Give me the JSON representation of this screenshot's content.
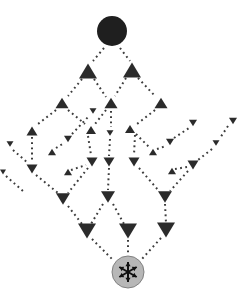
{
  "figure": {
    "width": 241,
    "height": 291,
    "background": "#ffffff",
    "ink_color": "#2b2b2b",
    "dot_color": "#3c3c3c",
    "source": {
      "cx": 112,
      "cy": 31,
      "r": 15,
      "fill": "#1f1f1f"
    },
    "sink": {
      "cx": 128,
      "cy": 272,
      "r": 16,
      "fill": "#b7b7b7",
      "stroke": "#818181",
      "symbol": "asterisk-arrows",
      "symbol_color": "#101010",
      "arm_length": 10,
      "arm_angles_deg": [
        90,
        150,
        210,
        270,
        330,
        30
      ]
    },
    "triangles": [
      {
        "id": "U1",
        "cx": 88,
        "cy": 71,
        "w": 18,
        "dir": "up"
      },
      {
        "id": "U2",
        "cx": 132,
        "cy": 70,
        "w": 18,
        "dir": "up"
      },
      {
        "id": "U3",
        "cx": 62,
        "cy": 103,
        "w": 13,
        "dir": "up"
      },
      {
        "id": "U4",
        "cx": 111,
        "cy": 103,
        "w": 13,
        "dir": "up"
      },
      {
        "id": "U5",
        "cx": 161,
        "cy": 103,
        "w": 13,
        "dir": "up"
      },
      {
        "id": "U6",
        "cx": 32,
        "cy": 131,
        "w": 11,
        "dir": "up"
      },
      {
        "id": "U7",
        "cx": 91,
        "cy": 130,
        "w": 10,
        "dir": "up"
      },
      {
        "id": "U8",
        "cx": 130,
        "cy": 129,
        "w": 10,
        "dir": "up"
      },
      {
        "id": "U9",
        "cx": 52,
        "cy": 152,
        "w": 8,
        "dir": "up"
      },
      {
        "id": "U10",
        "cx": 153,
        "cy": 152,
        "w": 8,
        "dir": "up"
      },
      {
        "id": "U11",
        "cx": 68,
        "cy": 172,
        "w": 8,
        "dir": "up"
      },
      {
        "id": "U12",
        "cx": 172,
        "cy": 171,
        "w": 8,
        "dir": "up"
      },
      {
        "id": "D1",
        "cx": 93,
        "cy": 111,
        "w": 7,
        "dir": "down"
      },
      {
        "id": "D2",
        "cx": 110,
        "cy": 133,
        "w": 7,
        "dir": "down"
      },
      {
        "id": "D3",
        "cx": 10,
        "cy": 144,
        "w": 7,
        "dir": "down"
      },
      {
        "id": "D4",
        "cx": 68,
        "cy": 139,
        "w": 8,
        "dir": "down"
      },
      {
        "id": "D5",
        "cx": 170,
        "cy": 142,
        "w": 8,
        "dir": "down"
      },
      {
        "id": "D6",
        "cx": 193,
        "cy": 123,
        "w": 8,
        "dir": "down"
      },
      {
        "id": "D7",
        "cx": 233,
        "cy": 121,
        "w": 8,
        "dir": "down"
      },
      {
        "id": "D8",
        "cx": 216,
        "cy": 143,
        "w": 7,
        "dir": "down"
      },
      {
        "id": "D10",
        "cx": 3,
        "cy": 172,
        "w": 6,
        "dir": "down"
      },
      {
        "id": "D11",
        "cx": 32,
        "cy": 169,
        "w": 11,
        "dir": "down"
      },
      {
        "id": "D12",
        "cx": 92,
        "cy": 162,
        "w": 11,
        "dir": "down"
      },
      {
        "id": "D13",
        "cx": 109,
        "cy": 162,
        "w": 11,
        "dir": "down"
      },
      {
        "id": "D14",
        "cx": 134,
        "cy": 162,
        "w": 11,
        "dir": "down"
      },
      {
        "id": "D15",
        "cx": 193,
        "cy": 165,
        "w": 11,
        "dir": "down"
      },
      {
        "id": "D16",
        "cx": 63,
        "cy": 199,
        "w": 14,
        "dir": "down"
      },
      {
        "id": "D17",
        "cx": 108,
        "cy": 197,
        "w": 14,
        "dir": "down"
      },
      {
        "id": "D18",
        "cx": 165,
        "cy": 197,
        "w": 14,
        "dir": "down"
      },
      {
        "id": "D19",
        "cx": 87,
        "cy": 231,
        "w": 18,
        "dir": "down"
      },
      {
        "id": "D20",
        "cx": 128,
        "cy": 231,
        "w": 18,
        "dir": "down"
      },
      {
        "id": "D21",
        "cx": 166,
        "cy": 230,
        "w": 18,
        "dir": "down"
      }
    ],
    "edges": [
      {
        "from": "source",
        "to": "U1",
        "x1": 104,
        "y1": 48,
        "x2": 93,
        "y2": 61
      },
      {
        "from": "source",
        "to": "U2",
        "x1": 120,
        "y1": 48,
        "x2": 130,
        "y2": 61
      },
      {
        "from": "U1",
        "to": "U3",
        "x1": 82,
        "y1": 79,
        "x2": 68,
        "y2": 96
      },
      {
        "from": "U1",
        "to": "U4",
        "x1": 94,
        "y1": 79,
        "x2": 106,
        "y2": 97
      },
      {
        "from": "U2",
        "to": "U4",
        "x1": 126,
        "y1": 78,
        "x2": 115,
        "y2": 96
      },
      {
        "from": "U2",
        "to": "U5",
        "x1": 138,
        "y1": 78,
        "x2": 155,
        "y2": 96
      },
      {
        "from": "U3",
        "to": "U6",
        "x1": 56,
        "y1": 110,
        "x2": 38,
        "y2": 124
      },
      {
        "from": "U3",
        "to": "U7",
        "x1": 68,
        "y1": 110,
        "x2": 85,
        "y2": 124
      },
      {
        "from": "U4",
        "to": "U7",
        "x1": 106,
        "y1": 110,
        "x2": 95,
        "y2": 124
      },
      {
        "from": "U4",
        "to": "D2",
        "x1": 111,
        "y1": 111,
        "x2": 111,
        "y2": 127
      },
      {
        "from": "D2",
        "to": "D13",
        "x1": 110,
        "y1": 139,
        "x2": 109,
        "y2": 156
      },
      {
        "from": "U5",
        "to": "U8",
        "x1": 155,
        "y1": 110,
        "x2": 137,
        "y2": 124
      },
      {
        "from": "U6",
        "to": "D11",
        "x1": 32,
        "y1": 137,
        "x2": 32,
        "y2": 162
      },
      {
        "from": "U7",
        "to": "D12",
        "x1": 88,
        "y1": 136,
        "x2": 91,
        "y2": 155
      },
      {
        "from": "U8",
        "to": "D14",
        "x1": 135,
        "y1": 135,
        "x2": 134,
        "y2": 155
      },
      {
        "from": "U8",
        "to": "U10",
        "x1": 136,
        "y1": 134,
        "x2": 149,
        "y2": 147
      },
      {
        "from": "U9",
        "to": "D4",
        "x1": 56,
        "y1": 148,
        "x2": 64,
        "y2": 143
      },
      {
        "from": "D4",
        "to": "D1",
        "x1": 72,
        "y1": 134,
        "x2": 89,
        "y2": 116
      },
      {
        "from": "U10",
        "to": "D5",
        "x1": 157,
        "y1": 149,
        "x2": 166,
        "y2": 146
      },
      {
        "from": "D5",
        "to": "D6",
        "x1": 174,
        "y1": 138,
        "x2": 189,
        "y2": 128
      },
      {
        "from": "D3",
        "to": "D11",
        "x1": 13,
        "y1": 150,
        "x2": 28,
        "y2": 163
      },
      {
        "from": "D11",
        "to": "D16",
        "x1": 36,
        "y1": 175,
        "x2": 58,
        "y2": 193
      },
      {
        "from": "D7",
        "to": "D8",
        "x1": 228,
        "y1": 126,
        "x2": 220,
        "y2": 138
      },
      {
        "from": "D8",
        "to": "D15",
        "x1": 212,
        "y1": 149,
        "x2": 198,
        "y2": 160
      },
      {
        "from": "D15",
        "to": "D18",
        "x1": 188,
        "y1": 171,
        "x2": 170,
        "y2": 191
      },
      {
        "from": "U11",
        "to": "D12",
        "x1": 71,
        "y1": 170,
        "x2": 86,
        "y2": 165
      },
      {
        "from": "U12",
        "to": "D15",
        "x1": 175,
        "y1": 169,
        "x2": 187,
        "y2": 167
      },
      {
        "from": "D12",
        "to": "D16",
        "x1": 88,
        "y1": 168,
        "x2": 68,
        "y2": 193
      },
      {
        "from": "D13",
        "to": "D17",
        "x1": 109,
        "y1": 168,
        "x2": 108,
        "y2": 190
      },
      {
        "from": "D14",
        "to": "D18",
        "x1": 139,
        "y1": 168,
        "x2": 159,
        "y2": 191
      },
      {
        "from": "D16",
        "to": "D19",
        "x1": 68,
        "y1": 206,
        "x2": 82,
        "y2": 224
      },
      {
        "from": "D17",
        "to": "D19",
        "x1": 103,
        "y1": 204,
        "x2": 91,
        "y2": 224
      },
      {
        "from": "D17",
        "to": "D20",
        "x1": 113,
        "y1": 204,
        "x2": 124,
        "y2": 224
      },
      {
        "from": "D18",
        "to": "D21",
        "x1": 165,
        "y1": 204,
        "x2": 166,
        "y2": 223
      },
      {
        "from": "D19",
        "to": "sink",
        "x1": 92,
        "y1": 239,
        "x2": 114,
        "y2": 261
      },
      {
        "from": "D20",
        "to": "sink",
        "x1": 128,
        "y1": 240,
        "x2": 128,
        "y2": 254
      },
      {
        "from": "D21",
        "to": "sink",
        "x1": 161,
        "y1": 238,
        "x2": 141,
        "y2": 260
      },
      {
        "from": "D10",
        "to": "D16",
        "x1": 6,
        "y1": 176,
        "x2": 24,
        "y2": 192
      }
    ]
  }
}
